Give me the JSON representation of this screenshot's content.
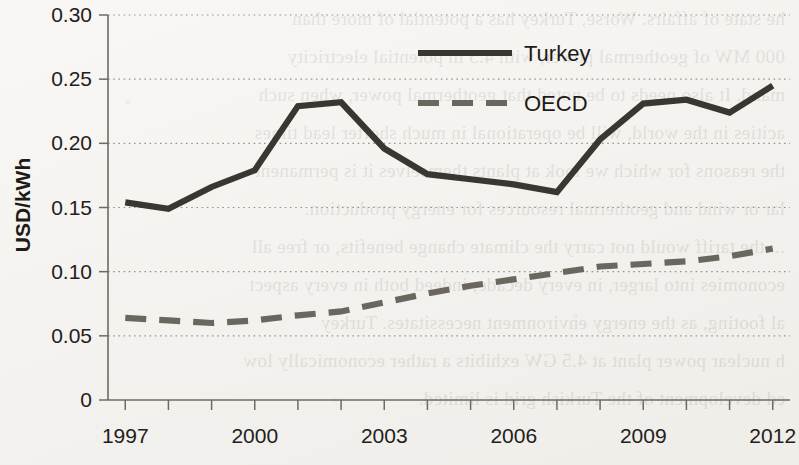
{
  "chart_data": {
    "type": "line",
    "title": "",
    "xlabel": "",
    "ylabel": "USD/kWh",
    "x": [
      1997,
      1998,
      1999,
      2000,
      2001,
      2002,
      2003,
      2004,
      2005,
      2006,
      2007,
      2008,
      2009,
      2010,
      2011,
      2012
    ],
    "xticklabels": [
      "1997",
      "2000",
      "2003",
      "2006",
      "2009",
      "2012"
    ],
    "xticks": [
      1997,
      2000,
      2003,
      2006,
      2009,
      2012
    ],
    "xlim": [
      1996.6,
      2012.4
    ],
    "ylim": [
      0,
      0.3
    ],
    "yticks": [
      0,
      0.05,
      0.1,
      0.15,
      0.2,
      0.25,
      0.3
    ],
    "yticklabels": [
      "0",
      "0.05",
      "0.10",
      "0.15",
      "0.20",
      "0.25",
      "0.30"
    ],
    "grid": "horizontal-dotted",
    "legend_position": "top-center",
    "series": [
      {
        "name": "Turkey",
        "style": "solid",
        "color": "#3a3732",
        "values": [
          0.154,
          0.149,
          0.166,
          0.179,
          0.229,
          0.232,
          0.196,
          0.176,
          0.172,
          0.168,
          0.162,
          0.203,
          0.231,
          0.234,
          0.224,
          0.245
        ]
      },
      {
        "name": "OECD",
        "style": "dashed",
        "color": "#6b675f",
        "values": [
          0.064,
          0.062,
          0.06,
          0.062,
          0.066,
          0.069,
          0.076,
          0.083,
          0.089,
          0.094,
          0.099,
          0.104,
          0.106,
          0.108,
          0.112,
          0.118
        ]
      }
    ]
  },
  "legend": {
    "turkey_label": "Turkey",
    "oecd_label": "OECD"
  },
  "background_text": {
    "lines": [
      "he state of affairs. Worse, Turkey has a potential of more than",
      "000 MW of geothermal power, with 4.5 in potential electricity",
      "mand. It also needs to be noted that geothermal power, when such",
      "acities in the world, will be operational in much shorter lead times",
      "the reasons for which we look at plants themselves it is permanent",
      "lar or wind and geothermal resources for energy production.",
      "... the tariff would not carry the climate change benefits, or free all",
      "economies into larger, in every decade, indeed both in every aspect",
      "al footing, as the energy environment necessitates. Turkey",
      "h nuclear power plant at 4.5 GW exhibits a rather economically low",
      "ed development of the Turkish grid is limited."
    ]
  }
}
